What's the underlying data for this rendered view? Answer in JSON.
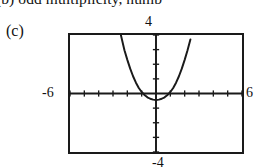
{
  "caption_above": {
    "text": "(b) odd multiplicity, numb"
  },
  "part_label": "(c)",
  "chart_data": {
    "type": "line",
    "title": "",
    "subtitle": "",
    "xlabel": "",
    "ylabel": "",
    "grid": false,
    "legend": null,
    "style": "graphing-calculator-window",
    "xlim": [
      -6,
      6
    ],
    "ylim": [
      -4,
      4
    ],
    "axis_tick_spacing_x": 1,
    "axis_tick_spacing_y": 1,
    "window_labels": {
      "ymax": "4",
      "xmin": "-6",
      "xmax": "6",
      "ymin": "-4"
    },
    "series": [
      {
        "name": "parabola",
        "description": "upward opening parabola, vertex slightly below x-axis, two real roots",
        "x": [
          -2.45,
          -2.2,
          -2.0,
          -1.8,
          -1.6,
          -1.4,
          -1.2,
          -1.0,
          -0.8,
          -0.6,
          -0.4,
          -0.2,
          0.0,
          0.2,
          0.4,
          0.6,
          0.8,
          1.0,
          1.2,
          1.4,
          1.6,
          1.8,
          2.0,
          2.2,
          2.4
        ],
        "y": [
          4.0,
          2.96,
          2.3,
          1.7,
          1.18,
          0.74,
          0.38,
          0.1,
          -0.1,
          -0.26,
          -0.36,
          -0.42,
          -0.44,
          -0.42,
          -0.36,
          -0.26,
          -0.1,
          0.1,
          0.38,
          0.74,
          1.18,
          1.7,
          2.3,
          2.96,
          3.7
        ],
        "color": "#1a1a1a"
      }
    ],
    "roots": [
      -0.85,
      0.85
    ],
    "vertex": [
      -0.1,
      -0.45
    ]
  },
  "colors": {
    "ink": "#1a1a1a",
    "background": "#ffffff",
    "curve": "#1a1a1a"
  }
}
